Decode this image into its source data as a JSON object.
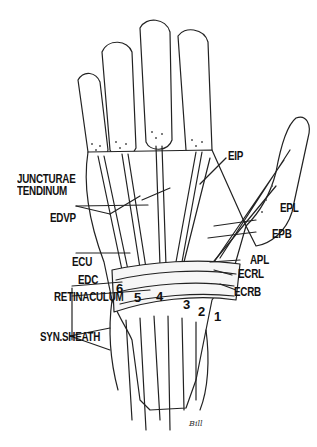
{
  "figure": {
    "labels_left": {
      "juncturae": "JUNCTURAE",
      "tendinum": "TENDINUM",
      "edqp": "EDVP",
      "ecu": "ECU",
      "edc": "EDC",
      "retinaculum": "RETINACULUM",
      "syn_sheath": "SYN.SHEATH"
    },
    "labels_right": {
      "eip": "EIP",
      "epl": "EPL",
      "epb": "EPB",
      "apl": "APL",
      "ecrl": "ECRL",
      "ecrb": "ECRB"
    },
    "compartments": [
      "6",
      "5",
      "4",
      "3",
      "2",
      "1"
    ],
    "signature": "Bill"
  }
}
